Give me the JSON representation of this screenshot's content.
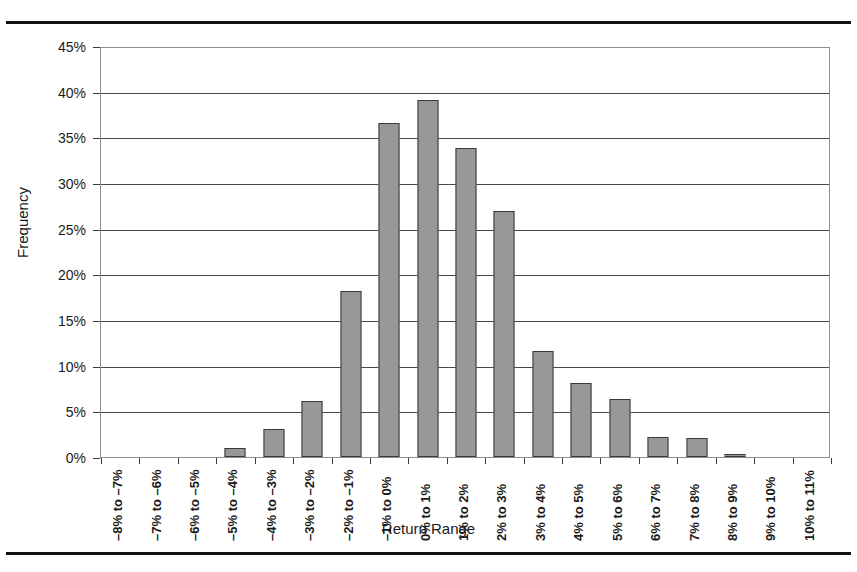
{
  "page": {
    "top_caption": "",
    "rules": [
      "top-rule",
      "bottom-rule"
    ]
  },
  "chart_data": {
    "type": "bar",
    "title": "",
    "xlabel": "Return Range",
    "ylabel": "Frequency",
    "ylim": [
      0,
      45
    ],
    "ytick_labels": [
      "45%",
      "40%",
      "35%",
      "30%",
      "25%",
      "20%",
      "15%",
      "10%",
      "5%",
      "0%"
    ],
    "ytick_values": [
      45,
      40,
      35,
      30,
      25,
      20,
      15,
      10,
      5,
      0
    ],
    "grid": true,
    "legend": "none",
    "bar_color": "#989898",
    "bar_edge_color": "#3a3a3a",
    "categories": [
      "–8% to –7%",
      "–7% to –6%",
      "–6% to –5%",
      "–5% to –4%",
      "–4% to –3%",
      "–3% to –2%",
      "–2% to –1%",
      "–1% to 0%",
      "0% to 1%",
      "1% to 2%",
      "2% to 3%",
      "3% to 4%",
      "4% to 5%",
      "5% to 6%",
      "6% to 7%",
      "7% to 8%",
      "8% to 9%",
      "9% to 10%",
      "10% to 11%"
    ],
    "values": [
      0,
      0,
      0,
      1.0,
      3.1,
      6.2,
      18.3,
      36.8,
      39.3,
      34.0,
      27.1,
      11.7,
      8.1,
      6.4,
      2.2,
      2.1,
      0.3,
      0,
      0
    ],
    "value_unit": "%"
  }
}
